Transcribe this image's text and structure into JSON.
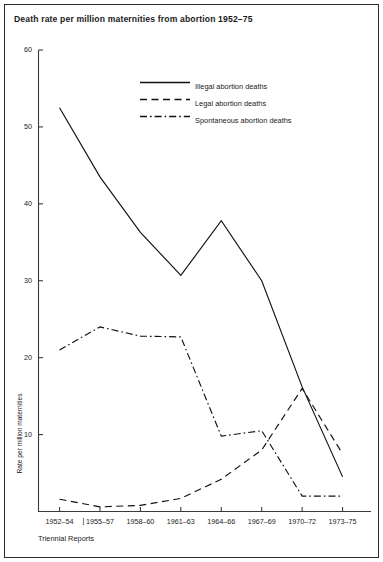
{
  "chart_data": {
    "type": "line",
    "title": "Death rate per million maternities from abortion 1952–75",
    "xlabel": "Triennial Reports",
    "ylabel": "Rate per million maternities",
    "categories": [
      "1952–54",
      "1955–57",
      "1958–60",
      "1961–63",
      "1964–66",
      "1967–69",
      "1970–72",
      "1973–75"
    ],
    "yticks": [
      10,
      20,
      30,
      40,
      50,
      60
    ],
    "ylim": [
      0,
      60
    ],
    "grid": false,
    "legend_position": "upper-right-inside",
    "series": [
      {
        "name": "Illegal abortion deaths",
        "style": "solid",
        "values": [
          52.5,
          43.5,
          36.3,
          30.7,
          37.8,
          30.0,
          16.2,
          4.5
        ]
      },
      {
        "name": "Legal abortion deaths",
        "style": "dashed",
        "values": [
          1.6,
          0.6,
          0.8,
          1.7,
          4.2,
          8.0,
          16.0,
          7.5
        ]
      },
      {
        "name": "Spontaneous abortion deaths",
        "style": "dash-dot",
        "values": [
          21.0,
          24.0,
          22.8,
          22.7,
          9.8,
          10.5,
          2.0,
          2.0
        ]
      }
    ]
  },
  "axis": {
    "separator_mark": "|"
  }
}
